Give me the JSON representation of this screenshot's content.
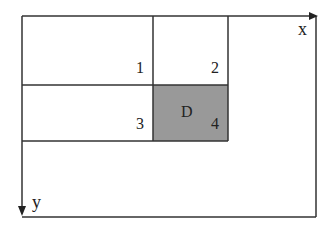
{
  "diagram": {
    "axes": {
      "x_label": "x",
      "y_label": "y"
    },
    "cells": [
      {
        "id": "1",
        "label": "1",
        "shaded": false
      },
      {
        "id": "2",
        "label": "2",
        "shaded": false
      },
      {
        "id": "3",
        "label": "3",
        "shaded": false
      },
      {
        "id": "4",
        "label": "4",
        "shaded": true
      }
    ],
    "region_label": "D",
    "colors": {
      "line": "#333333",
      "shade": "#999999",
      "background": "#ffffff"
    }
  }
}
